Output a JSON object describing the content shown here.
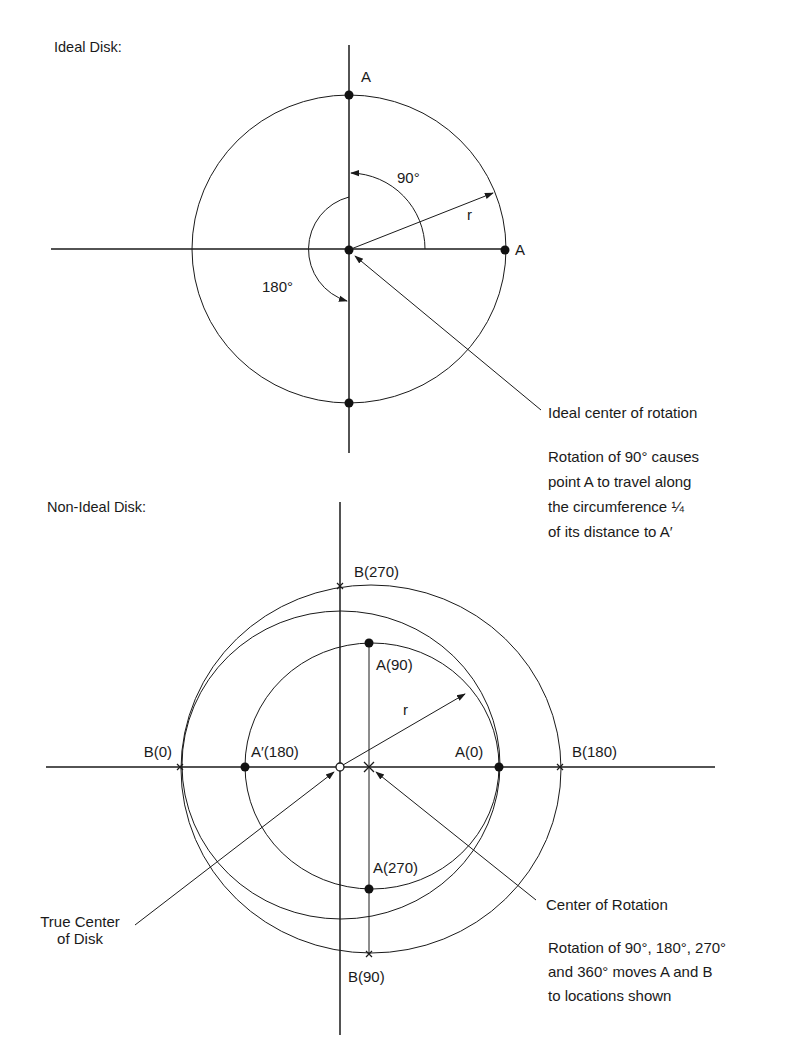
{
  "ideal": {
    "heading": "Ideal Disk:",
    "label_A_top": "A",
    "label_A_right": "A",
    "label_r": "r",
    "angle_90": "90°",
    "angle_180": "180°",
    "center_callout": "Ideal center of rotation",
    "note_lines": [
      "Rotation of 90° causes",
      "point A to travel along",
      "the circumference ¼",
      "of its distance to A′"
    ]
  },
  "nonideal": {
    "heading": "Non-Ideal Disk:",
    "labels": {
      "B270": "B(270)",
      "A90": "A(90)",
      "r": "r",
      "B0": "B(0)",
      "Aprime180": "A′(180)",
      "A0": "A(0)",
      "B180": "B(180)",
      "A270": "A(270)",
      "B90": "B(90)"
    },
    "true_center_lines": [
      "True Center",
      "of Disk"
    ],
    "rotation_center_callout": "Center of Rotation",
    "note_lines": [
      "Rotation of 90°, 180°, 270°",
      "and 360° moves A and B",
      "to locations shown"
    ]
  },
  "colors": {
    "ink": "#1a1a1a",
    "paper": "#ffffff"
  }
}
